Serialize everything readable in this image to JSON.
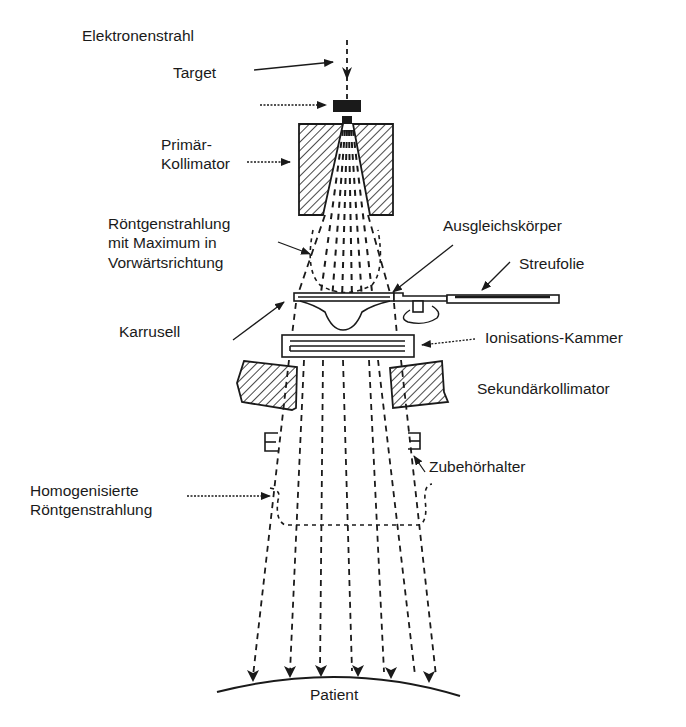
{
  "diagram": {
    "type": "linac-treatment-head-schematic",
    "colors": {
      "ink": "#1a1a1a",
      "background": "#ffffff",
      "hatch": "#1a1a1a"
    },
    "labels": {
      "elektronenstrahl": "Elektronenstrahl",
      "target": "Target",
      "primaer_kollimator_1": "Primär-",
      "primaer_kollimator_2": "Kollimator",
      "roentgen_max_1": "Röntgenstrahlung",
      "roentgen_max_2": "mit Maximum  in",
      "roentgen_max_3": "Vorwärtsrichtung",
      "ausgleichskoerper": "Ausgleichskörper",
      "streufolie": "Streufolie",
      "karrusell": "Karrusell",
      "ionisationskammer": "Ionisations-Kammer",
      "sekundaerkollimator": "Sekundärkollimator",
      "zubehoerhalter": "Zubehörhalter",
      "homogen_1": "Homogenisierte",
      "homogen_2": "Röntgenstrahlung",
      "patient": "Patient"
    },
    "components": [
      "electron-beam",
      "target",
      "primary-collimator",
      "forward-peaked-xray-beam",
      "flattening-filter",
      "scattering-foil",
      "carousel",
      "ionization-chamber",
      "secondary-collimator",
      "accessory-holder",
      "homogenized-xray-beam",
      "patient-surface"
    ],
    "beam_rays_count": 7
  }
}
